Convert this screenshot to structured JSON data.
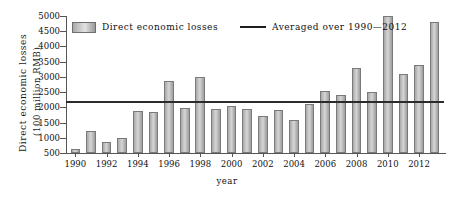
{
  "chart_data": {
    "type": "bar",
    "title": "",
    "xlabel": "year",
    "ylabel": "Direct economic losses (100 million RMB)",
    "ylabel_line1": "Direct economic losses",
    "ylabel_line2": "(100 million RMB)",
    "ylim": [
      500,
      5000
    ],
    "yticks": [
      500,
      1000,
      1500,
      2000,
      2500,
      3000,
      3500,
      4000,
      4500,
      5000
    ],
    "ytick_labels": [
      "500",
      "1000",
      "1500",
      "2000",
      "2500",
      "3000",
      "3500",
      "4000",
      "4500",
      "5000"
    ],
    "xlim": [
      1989.4,
      2013.6
    ],
    "xticks": [
      1990,
      1992,
      1994,
      1996,
      1998,
      2000,
      2002,
      2004,
      2006,
      2008,
      2010,
      2012
    ],
    "xtick_labels": [
      "1990",
      "1992",
      "1994",
      "1996",
      "1998",
      "2000",
      "2002",
      "2004",
      "2006",
      "2008",
      "2010",
      "2012"
    ],
    "grid": false,
    "legend_position": "top-left-inside",
    "categories": [
      1990,
      1991,
      1992,
      1993,
      1994,
      1995,
      1996,
      1997,
      1998,
      1999,
      2000,
      2001,
      2002,
      2003,
      2004,
      2005,
      2006,
      2007,
      2008,
      2009,
      2010,
      2011,
      2012,
      2013
    ],
    "series": [
      {
        "name": "Direct economic losses",
        "type": "bar",
        "color": "#c4c4c4",
        "edge_color": "#7a7a7a",
        "values": [
          620,
          1215,
          855,
          990,
          1875,
          1840,
          2880,
          1980,
          3010,
          1950,
          2040,
          1950,
          1720,
          1920,
          1570,
          2110,
          2530,
          2400,
          3280,
          2510,
          5000,
          3080,
          3380,
          4800
        ]
      },
      {
        "name": "Averaged over 1990—2012",
        "type": "line",
        "color": "#1f1f1f",
        "value": 2200
      }
    ],
    "annotations": []
  },
  "legend": {
    "bar_label": "Direct economic losses",
    "line_label": "Averaged over 1990—2012"
  },
  "axes": {
    "x_title": "year",
    "y_title_line1": "Direct economic losses",
    "y_title_line2": "(100 million RMB)"
  }
}
